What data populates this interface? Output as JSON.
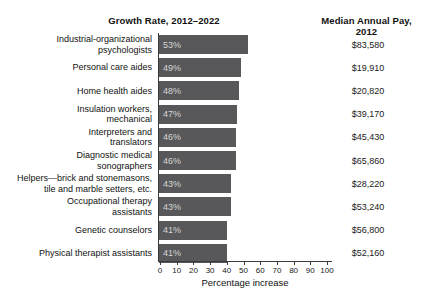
{
  "header": {
    "growth_title": "Growth Rate, 2012–2022",
    "pay_title": "Median Annual Pay, 2012"
  },
  "chart_data": {
    "type": "bar",
    "orientation": "horizontal",
    "title": "Growth Rate, 2012–2022",
    "secondary_column_title": "Median Annual Pay, 2012",
    "xlabel": "Percentage increase",
    "xlim": [
      0,
      100
    ],
    "xticks": [
      0,
      10,
      20,
      30,
      40,
      50,
      60,
      70,
      80,
      90,
      100
    ],
    "grid": false,
    "legend": "none",
    "categories": [
      "Industrial-organizational psychologists",
      "Personal care aides",
      "Home health aides",
      "Insulation workers, mechanical",
      "Interpreters and translators",
      "Diagnostic medical sonographers",
      "Helpers—brick and stonemasons, tile and marble setters, etc.",
      "Occupational therapy assistants",
      "Genetic counselors",
      "Physical therapist assistants"
    ],
    "label_lines": [
      [
        "Industrial-organizational",
        "psychologists"
      ],
      [
        "Personal care aides"
      ],
      [
        "Home health aides"
      ],
      [
        "Insulation workers,",
        "mechanical"
      ],
      [
        "Interpreters and",
        "translators"
      ],
      [
        "Diagnostic medical",
        "sonographers"
      ],
      [
        "Helpers—brick and stonemasons,",
        "tile and marble setters, etc."
      ],
      [
        "Occupational therapy",
        "assistants"
      ],
      [
        "Genetic counselors"
      ],
      [
        "Physical therapist assistants"
      ]
    ],
    "values": [
      53,
      49,
      48,
      47,
      46,
      46,
      43,
      43,
      41,
      41
    ],
    "bar_labels": [
      "53%",
      "49%",
      "48%",
      "47%",
      "46%",
      "46%",
      "43%",
      "43%",
      "41%",
      "41%"
    ],
    "pay_values": [
      "$83,580",
      "$19,910",
      "$20,820",
      "$39,170",
      "$45,430",
      "$65,860",
      "$28,220",
      "$53,240",
      "$56,800",
      "$52,160"
    ],
    "colors": {
      "bar": "#58585a",
      "bar_label": "#d6d6d6",
      "axis": "#3a3a3a",
      "text": "#1a1a1a",
      "background": "#ffffff"
    }
  }
}
